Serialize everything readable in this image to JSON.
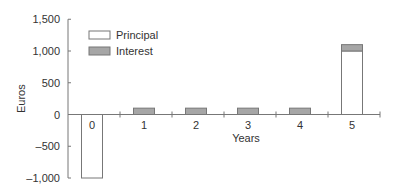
{
  "chart_data": {
    "type": "bar",
    "title": "",
    "xlabel": "Years",
    "ylabel": "Euros",
    "categories": [
      "0",
      "1",
      "2",
      "3",
      "4",
      "5"
    ],
    "series": [
      {
        "name": "Principal",
        "values": [
          -1000,
          0,
          0,
          0,
          0,
          1000
        ],
        "color": "#ffffff"
      },
      {
        "name": "Interest",
        "values": [
          0,
          100,
          100,
          100,
          100,
          100
        ],
        "color": "#a6a6a6"
      }
    ],
    "stacked": true,
    "ylim": [
      -1000,
      1500
    ],
    "yticks": [
      1500,
      1000,
      500,
      0,
      -500,
      -1000
    ],
    "ytick_labels": [
      "1,500",
      "1,000",
      "500",
      "0",
      "–500",
      "–1,000"
    ],
    "grid": false,
    "legend_position": "upper-left"
  },
  "legend": {
    "principal": "Principal",
    "interest": "Interest"
  }
}
